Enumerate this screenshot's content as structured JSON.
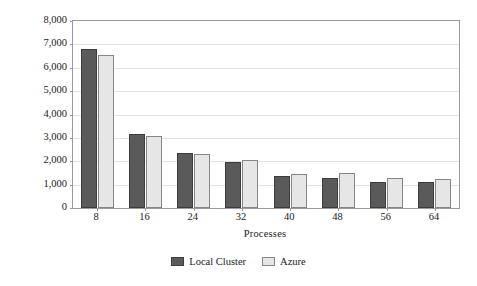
{
  "chart_data": {
    "type": "bar",
    "title": "",
    "xlabel": "Processes",
    "ylabel": "Execution time [s]",
    "categories": [
      "8",
      "16",
      "24",
      "32",
      "40",
      "48",
      "56",
      "64"
    ],
    "series": [
      {
        "name": "Local Cluster",
        "color": "#5a5a5a",
        "values": [
          6800,
          3150,
          2350,
          1980,
          1370,
          1290,
          1110,
          1120
        ]
      },
      {
        "name": "Azure",
        "color": "#e6e6e6",
        "values": [
          6550,
          3070,
          2310,
          2050,
          1450,
          1490,
          1280,
          1220
        ]
      }
    ],
    "ylim": [
      0,
      8000
    ],
    "ytick_values": [
      0,
      1000,
      2000,
      3000,
      4000,
      5000,
      6000,
      7000,
      8000
    ],
    "ytick_labels": [
      "0",
      "1,000",
      "2,000",
      "3,000",
      "4,000",
      "5,000",
      "6,000",
      "7,000",
      "8,000"
    ],
    "grid": "horizontal",
    "legend_position": "below"
  }
}
